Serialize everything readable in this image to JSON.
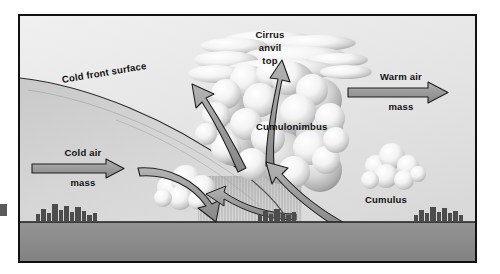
{
  "diagram": {
    "title_hidden": "",
    "type": "cold front cross-section",
    "labels": {
      "cold_front_surface": "Cold front  surface",
      "cirrus_line1": "Cirrus",
      "cirrus_line2": "anvil",
      "cirrus_line3": "top",
      "cumulonimbus": "Cumulonimbus",
      "cumulus": "Cumulus",
      "cold_air_line1": "Cold air",
      "cold_air_line2": "mass",
      "warm_air_line1": "Warm air",
      "warm_air_line2": "mass"
    },
    "colors": {
      "sky_light": "#ededed",
      "sky_mid": "#dedede",
      "cold_wedge": "#d2d2d2",
      "ground": "#8d8d8d",
      "cloud_white": "#fbfbfb",
      "cloud_shadow": "#a9a9a9",
      "arrow_fill": "#9a9a9a",
      "outline": "#1a1a1a",
      "border": "#111111",
      "city": "#4a4a4a",
      "rain": "#9c9c9c"
    },
    "elements": {
      "cold_air_arrow": "horizontal block arrow pointing right",
      "warm_air_arrow": "horizontal block arrow pointing right",
      "updraft_arrows": "two large curved arrows rising into the cumulonimbus",
      "downdraft_arrow": "curved arrow descending to the left at the front",
      "inflow_arrow": "curved arrow entering from lower right",
      "rain_shaft": "vertical hatching beneath the cumulonimbus base",
      "skyline_left": "city skyline silhouette on cold side",
      "skyline_right": "city skyline silhouette on warm side"
    }
  }
}
